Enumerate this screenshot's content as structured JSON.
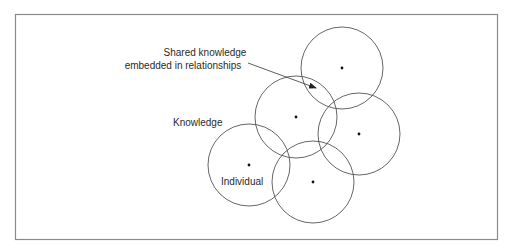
{
  "diagram": {
    "labels": {
      "shared_line1": "Shared knowledge",
      "shared_line2": "embedded in relationships",
      "knowledge": "Knowledge",
      "individual": "Individual"
    },
    "circles": [
      {
        "id": "top",
        "cx": 342,
        "cy": 68,
        "r": 41
      },
      {
        "id": "middle",
        "cx": 296,
        "cy": 117,
        "r": 41
      },
      {
        "id": "right",
        "cx": 359,
        "cy": 134,
        "r": 41
      },
      {
        "id": "individual",
        "cx": 249,
        "cy": 165,
        "r": 41
      },
      {
        "id": "bottom",
        "cx": 313,
        "cy": 182,
        "r": 41
      }
    ],
    "colors": {
      "stroke": "#555555",
      "frame": "#8a8a8a",
      "text": "#2a2a2a"
    }
  }
}
